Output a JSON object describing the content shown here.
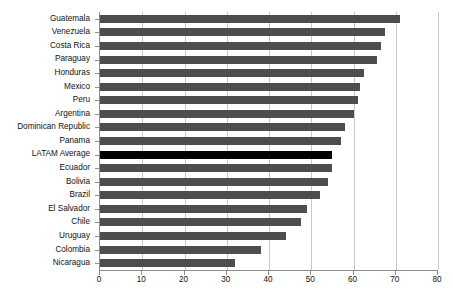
{
  "chart_data": {
    "type": "bar",
    "orientation": "horizontal",
    "title": "",
    "subtitle": "",
    "xlabel": "",
    "ylabel": "",
    "xlim": [
      0,
      80
    ],
    "xticks": [
      0,
      10,
      20,
      30,
      40,
      50,
      60,
      70,
      80
    ],
    "xtick_labels": [
      "0",
      "10",
      "20",
      "30",
      "40",
      "50",
      "60",
      "70",
      "80"
    ],
    "grid": "vertical",
    "legend": "none",
    "categories": [
      "Guatemala",
      "Venezuela",
      "Costa Rica",
      "Paraguay",
      "Honduras",
      "Mexico",
      "Peru",
      "Argentina",
      "Dominican Republic",
      "Panama",
      "LATAM Average",
      "Ecuador",
      "Bolivia",
      "Brazil",
      "El Salvador",
      "Chile",
      "Uruguay",
      "Colombia",
      "Nicaragua"
    ],
    "values": [
      71,
      67.5,
      66.5,
      65.5,
      62.5,
      61.5,
      61,
      60,
      58,
      57,
      55,
      55,
      54,
      52,
      49,
      47.5,
      44,
      38,
      32
    ],
    "highlight_category": "LATAM Average",
    "colors": {
      "bar": "#4d4d4d",
      "highlight_bar": "#000000",
      "gridline": "#c9c9c9",
      "axis": "#8c8c8c",
      "text": "#111111",
      "background": "#ffffff"
    }
  }
}
